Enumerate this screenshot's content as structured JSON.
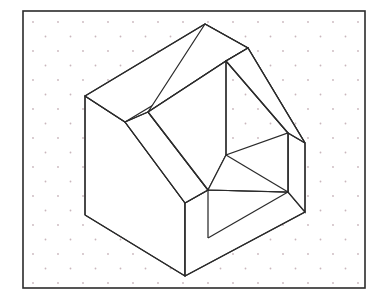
{
  "page": {
    "background_color": "#ffffff",
    "width": 390,
    "height": 303
  },
  "frame": {
    "name": "drawing-border",
    "stroke_color": "#2b2b2b",
    "stroke_width": 1.6,
    "x": 23,
    "y": 11,
    "width": 342,
    "height": 277
  },
  "grid": {
    "name": "isometric-dot-grid",
    "dot_color": "#c9b6bd",
    "dot_radius": 0.9,
    "col_spacing": 25,
    "row_spacing": 14.5,
    "row_offset": 12.5,
    "origin_x": 33,
    "origin_y": 22,
    "cols": 14,
    "rows": 19
  },
  "object": {
    "name": "isometric-chair-block",
    "description": "Isometric pictorial of an armchair-like block with an angled back rest, open seat cavity and two arm rails",
    "line_color": "#2b2b2b",
    "face_fill": "#ffffff",
    "line_width": 1.25,
    "vertices": {
      "apex_top": [
        205,
        24
      ],
      "ridge_right": [
        248,
        48
      ],
      "left_top_corner": [
        85,
        96
      ],
      "left_bottom_corner": [
        85,
        215
      ],
      "bottom_front": [
        185,
        276
      ],
      "front_edge_top": [
        185,
        203
      ],
      "inner_front_top": [
        208,
        190
      ],
      "inner_front_bottom": [
        208,
        238
      ],
      "slant_junction_left": [
        125,
        122
      ],
      "slant_inner_top": [
        148,
        112
      ],
      "inner_back_vertical_top": [
        226,
        61
      ],
      "inner_back_vertical_bottom": [
        226,
        155
      ],
      "right_roof_outer": [
        305,
        143
      ],
      "right_roof_inner": [
        288,
        133
      ],
      "right_bottom_outer": [
        305,
        212
      ],
      "inner_back_right": [
        288,
        192
      ],
      "seat_left": [
        185,
        203
      ],
      "seat_right": [
        288,
        192
      ]
    },
    "faces": [
      {
        "name": "left-side-face",
        "points": "85,96 125,122 185,203 185,276 85,215"
      },
      {
        "name": "back-rest-outer-face",
        "points": "85,96 205,24 248,48 125,122"
      },
      {
        "name": "back-rest-inner-band",
        "points": "125,122 148,112 208,190 185,203"
      },
      {
        "name": "back-rest-top-band",
        "points": "148,112 205,24 248,48 226,61"
      },
      {
        "name": "right-arm-outer-face",
        "points": "248,48 305,143 305,212 288,192 288,133 226,61"
      },
      {
        "name": "right-arm-top-band",
        "points": "248,48 305,143 288,133 226,61"
      },
      {
        "name": "inner-back-panel",
        "points": "148,112 226,61 226,155 208,190"
      },
      {
        "name": "seat-floor-face",
        "points": "185,203 208,190 288,192 288,192"
      },
      {
        "name": "front-bottom-face",
        "points": "185,276 185,203 208,238 305,212"
      }
    ]
  },
  "annotations": {
    "labels": []
  }
}
